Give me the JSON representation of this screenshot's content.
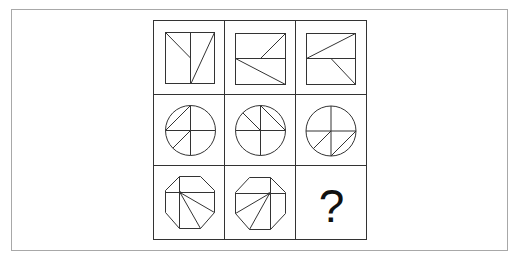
{
  "puzzle": {
    "type": "3x3 figure reasoning matrix",
    "rows": [
      {
        "shape": "square",
        "cells": [
          {
            "shape": "square",
            "dividers": [
              "vertical-center"
            ],
            "diagonals": [
              "top-left-corner-to-center-left-half",
              "top-right-corner-to-bottom-center"
            ]
          },
          {
            "shape": "square",
            "dividers": [
              "horizontal-center"
            ],
            "diagonals": [
              "top-right-corner-to-center",
              "left-center-to-bottom-right-corner"
            ]
          },
          {
            "shape": "square",
            "dividers": [
              "horizontal-center"
            ],
            "diagonals": [
              "left-center-to-top-right-corner",
              "center-to-bottom-right-corner"
            ]
          }
        ]
      },
      {
        "shape": "circle",
        "cells": [
          {
            "shape": "circle",
            "dividers": [
              "horizontal-diameter",
              "vertical-diameter"
            ],
            "diagonals": [
              "chord-left-to-top",
              "center-to-lower-left"
            ]
          },
          {
            "shape": "circle",
            "dividers": [
              "horizontal-diameter",
              "vertical-diameter"
            ],
            "diagonals": [
              "center-to-upper-left",
              "chord-top-to-right"
            ]
          },
          {
            "shape": "circle",
            "dividers": [
              "horizontal-diameter",
              "vertical-diameter"
            ],
            "diagonals": [
              "center-to-lower-left",
              "chord-bottom-to-right"
            ]
          }
        ]
      },
      {
        "shape": "octagon",
        "cells": [
          {
            "shape": "octagon",
            "dividers": [
              "vertical-left",
              "horizontal-upper"
            ],
            "diagonals": [
              "point-to-right-lower-vertex",
              "point-to-bottom-right-vertex"
            ]
          },
          {
            "shape": "octagon",
            "dividers": [
              "vertical-right",
              "horizontal-upper"
            ],
            "diagonals": [
              "point-to-left-lower-vertex",
              "point-to-bottom-left-vertex"
            ]
          },
          {
            "shape": "unknown",
            "label": "?"
          }
        ]
      }
    ],
    "missing_cell_label": "?"
  },
  "colors": {
    "frame_border": "#a8a8a8",
    "grid_line": "#333333",
    "figure_line": "#333333",
    "background": "#ffffff"
  }
}
